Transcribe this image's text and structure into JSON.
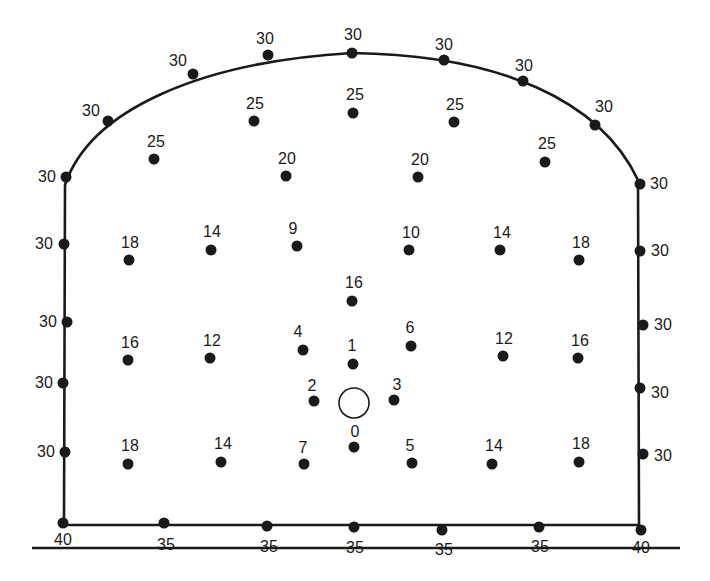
{
  "diagram": {
    "type": "tunnel-blast-hole-pattern",
    "outline_color": "#1a1a1a",
    "hole_color": "#1a1a1a",
    "empty_hole": {
      "x": 354,
      "y": 403,
      "r": 15
    },
    "ground_line": {
      "x1": 32,
      "x2": 680,
      "y": 548
    },
    "holes": [
      {
        "x": 66,
        "y": 177,
        "label": "30",
        "lx": 47,
        "ly": 182,
        "anchor": "middle"
      },
      {
        "x": 108,
        "y": 121,
        "label": "30",
        "lx": 91,
        "ly": 116,
        "anchor": "middle"
      },
      {
        "x": 193,
        "y": 74,
        "label": "30",
        "lx": 178,
        "ly": 66,
        "anchor": "middle"
      },
      {
        "x": 268,
        "y": 55,
        "label": "30",
        "lx": 265,
        "ly": 44,
        "anchor": "middle"
      },
      {
        "x": 352,
        "y": 53,
        "label": "30",
        "lx": 353,
        "ly": 40,
        "anchor": "middle"
      },
      {
        "x": 444,
        "y": 60,
        "label": "30",
        "lx": 444,
        "ly": 50,
        "anchor": "middle"
      },
      {
        "x": 523,
        "y": 81,
        "label": "30",
        "lx": 524,
        "ly": 71,
        "anchor": "middle"
      },
      {
        "x": 595,
        "y": 125,
        "label": "30",
        "lx": 604,
        "ly": 112,
        "anchor": "middle"
      },
      {
        "x": 640,
        "y": 184,
        "label": "30",
        "lx": 659,
        "ly": 189,
        "anchor": "middle"
      },
      {
        "x": 64,
        "y": 244,
        "label": "30",
        "lx": 44,
        "ly": 249,
        "anchor": "middle"
      },
      {
        "x": 67,
        "y": 322,
        "label": "30",
        "lx": 48,
        "ly": 327,
        "anchor": "middle"
      },
      {
        "x": 63,
        "y": 383,
        "label": "30",
        "lx": 44,
        "ly": 388,
        "anchor": "middle"
      },
      {
        "x": 65,
        "y": 452,
        "label": "30",
        "lx": 46,
        "ly": 457,
        "anchor": "middle"
      },
      {
        "x": 640,
        "y": 251,
        "label": "30",
        "lx": 660,
        "ly": 256,
        "anchor": "middle"
      },
      {
        "x": 643,
        "y": 325,
        "label": "30",
        "lx": 663,
        "ly": 330,
        "anchor": "middle"
      },
      {
        "x": 640,
        "y": 388,
        "label": "30",
        "lx": 660,
        "ly": 398,
        "anchor": "middle"
      },
      {
        "x": 643,
        "y": 454,
        "label": "30",
        "lx": 663,
        "ly": 461,
        "anchor": "middle"
      },
      {
        "x": 63,
        "y": 523,
        "label": "40",
        "lx": 63,
        "ly": 545,
        "anchor": "middle"
      },
      {
        "x": 164,
        "y": 523,
        "label": "35",
        "lx": 166,
        "ly": 550,
        "anchor": "middle"
      },
      {
        "x": 267,
        "y": 526,
        "label": "35",
        "lx": 269,
        "ly": 552,
        "anchor": "middle"
      },
      {
        "x": 354,
        "y": 527,
        "label": "35",
        "lx": 355,
        "ly": 553,
        "anchor": "middle"
      },
      {
        "x": 442,
        "y": 530,
        "label": "35",
        "lx": 444,
        "ly": 555,
        "anchor": "middle"
      },
      {
        "x": 539,
        "y": 527,
        "label": "35",
        "lx": 540,
        "ly": 552,
        "anchor": "middle"
      },
      {
        "x": 641,
        "y": 530,
        "label": "40",
        "lx": 641,
        "ly": 553,
        "anchor": "middle"
      },
      {
        "x": 154,
        "y": 159,
        "label": "25",
        "lx": 156,
        "ly": 147,
        "anchor": "middle"
      },
      {
        "x": 254,
        "y": 121,
        "label": "25",
        "lx": 255,
        "ly": 109,
        "anchor": "middle"
      },
      {
        "x": 353,
        "y": 113,
        "label": "25",
        "lx": 355,
        "ly": 100,
        "anchor": "middle"
      },
      {
        "x": 454,
        "y": 122,
        "label": "25",
        "lx": 455,
        "ly": 110,
        "anchor": "middle"
      },
      {
        "x": 545,
        "y": 162,
        "label": "25",
        "lx": 547,
        "ly": 149,
        "anchor": "middle"
      },
      {
        "x": 286,
        "y": 176,
        "label": "20",
        "lx": 287,
        "ly": 164,
        "anchor": "middle"
      },
      {
        "x": 418,
        "y": 177,
        "label": "20",
        "lx": 420,
        "ly": 165,
        "anchor": "middle"
      },
      {
        "x": 129,
        "y": 260,
        "label": "18",
        "lx": 130,
        "ly": 248,
        "anchor": "middle"
      },
      {
        "x": 211,
        "y": 250,
        "label": "14",
        "lx": 212,
        "ly": 237,
        "anchor": "middle"
      },
      {
        "x": 297,
        "y": 246,
        "label": "9",
        "lx": 293,
        "ly": 234,
        "anchor": "middle"
      },
      {
        "x": 409,
        "y": 250,
        "label": "10",
        "lx": 411,
        "ly": 238,
        "anchor": "middle"
      },
      {
        "x": 500,
        "y": 250,
        "label": "14",
        "lx": 502,
        "ly": 238,
        "anchor": "middle"
      },
      {
        "x": 579,
        "y": 260,
        "label": "18",
        "lx": 581,
        "ly": 248,
        "anchor": "middle"
      },
      {
        "x": 352,
        "y": 301,
        "label": "16",
        "lx": 354,
        "ly": 288,
        "anchor": "middle"
      },
      {
        "x": 128,
        "y": 360,
        "label": "16",
        "lx": 130,
        "ly": 348,
        "anchor": "middle"
      },
      {
        "x": 210,
        "y": 358,
        "label": "12",
        "lx": 212,
        "ly": 346,
        "anchor": "middle"
      },
      {
        "x": 303,
        "y": 350,
        "label": "4",
        "lx": 298,
        "ly": 337,
        "anchor": "middle"
      },
      {
        "x": 353,
        "y": 364,
        "label": "1",
        "lx": 352,
        "ly": 351,
        "anchor": "middle"
      },
      {
        "x": 411,
        "y": 346,
        "label": "6",
        "lx": 410,
        "ly": 333,
        "anchor": "middle"
      },
      {
        "x": 503,
        "y": 356,
        "label": "12",
        "lx": 504,
        "ly": 344,
        "anchor": "middle"
      },
      {
        "x": 578,
        "y": 358,
        "label": "16",
        "lx": 580,
        "ly": 346,
        "anchor": "middle"
      },
      {
        "x": 314,
        "y": 401,
        "label": "2",
        "lx": 312,
        "ly": 391,
        "anchor": "middle"
      },
      {
        "x": 394,
        "y": 400,
        "label": "3",
        "lx": 397,
        "ly": 390,
        "anchor": "middle"
      },
      {
        "x": 354,
        "y": 447,
        "label": "0",
        "lx": 355,
        "ly": 437,
        "anchor": "middle"
      },
      {
        "x": 128,
        "y": 464,
        "label": "18",
        "lx": 130,
        "ly": 451,
        "anchor": "middle"
      },
      {
        "x": 221,
        "y": 462,
        "label": "14",
        "lx": 223,
        "ly": 449,
        "anchor": "middle"
      },
      {
        "x": 304,
        "y": 464,
        "label": "7",
        "lx": 303,
        "ly": 453,
        "anchor": "middle"
      },
      {
        "x": 412,
        "y": 463,
        "label": "5",
        "lx": 410,
        "ly": 451,
        "anchor": "middle"
      },
      {
        "x": 492,
        "y": 464,
        "label": "14",
        "lx": 494,
        "ly": 451,
        "anchor": "middle"
      },
      {
        "x": 579,
        "y": 462,
        "label": "18",
        "lx": 581,
        "ly": 449,
        "anchor": "middle"
      }
    ]
  }
}
